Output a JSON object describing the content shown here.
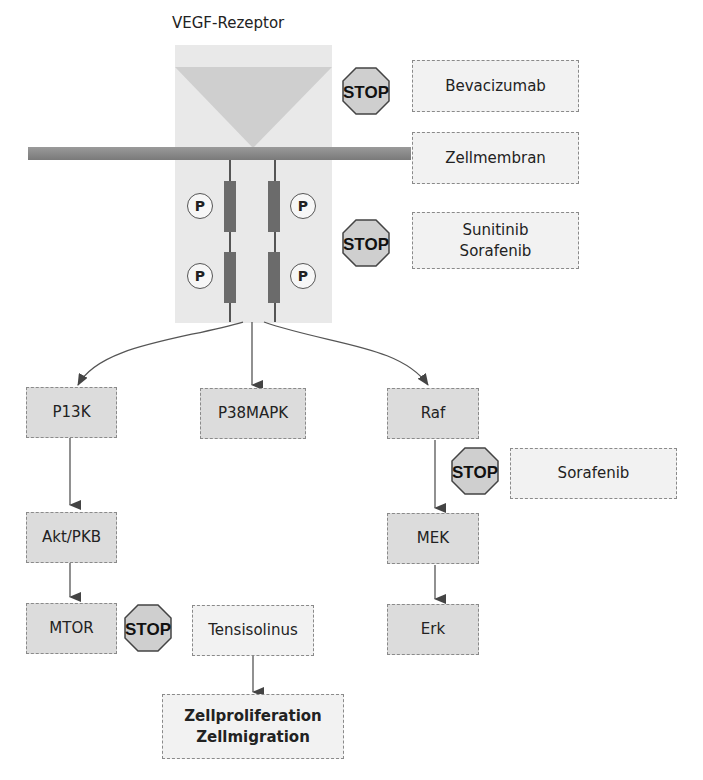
{
  "title": "VEGF-Rezeptor",
  "receptor": {
    "phospho_label": "P",
    "stop_label": "STOP"
  },
  "inhibitors": {
    "bevacizumab": "Bevacizumab",
    "membrane": "Zellmembran",
    "sunitinib_sorafenib_line1": "Sunitinib",
    "sunitinib_sorafenib_line2": "Sorafenib",
    "sorafenib": "Sorafenib",
    "tensisolinus": "Tensisolinus"
  },
  "pathways": {
    "left": [
      "P13K",
      "Akt/PKB",
      "MTOR"
    ],
    "middle": [
      "P38MAPK"
    ],
    "right": [
      "Raf",
      "MEK",
      "Erk"
    ]
  },
  "outcome": {
    "line1": "Zellproliferation",
    "line2": "Zellmigration"
  },
  "colors": {
    "node_fill": "#dcdcdc",
    "label_fill": "#f2f2f2",
    "receptor_fill": "#e9e9e9",
    "ligand_fill": "#cfcfcf",
    "stop_fill": "#cfcfcf",
    "line": "#555555"
  }
}
